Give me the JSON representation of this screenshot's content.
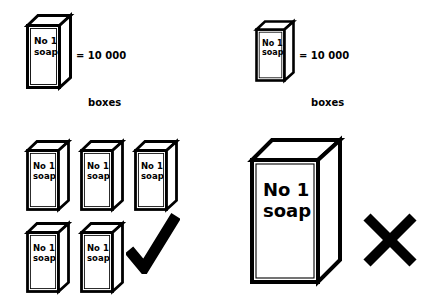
{
  "figure": {
    "type": "pictogram-convention-diagram",
    "background_color": "#ffffff",
    "ink_color": "#000000"
  },
  "box_label": {
    "line1": "No 1",
    "line2": "soap"
  },
  "legends": [
    {
      "id": "legend-left",
      "equals_line": "= 10 000",
      "unit_line": "boxes",
      "key_value": 10000,
      "unit": "boxes"
    },
    {
      "id": "legend-right",
      "equals_line": "= 10 000",
      "unit_line": "boxes",
      "key_value": 10000,
      "unit": "boxes"
    }
  ],
  "correct_example": {
    "id": "correct-example",
    "verdict_icon": "check-mark-icon",
    "verdict": "correct",
    "symbol_count": 5,
    "represented_value": 50000,
    "rows": [
      {
        "count": 3
      },
      {
        "count": 2
      }
    ]
  },
  "incorrect_example": {
    "id": "incorrect-example",
    "verdict_icon": "cross-mark-icon",
    "verdict": "incorrect",
    "symbol_count": 1,
    "represented_value": 50000,
    "note": "single enlarged symbol"
  }
}
